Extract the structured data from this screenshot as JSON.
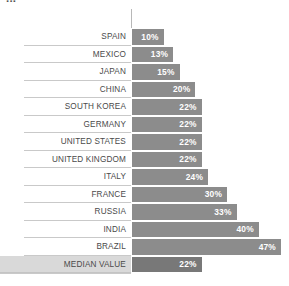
{
  "chart_data": {
    "type": "bar",
    "orientation": "horizontal",
    "title": "...",
    "xlabel": "",
    "ylabel": "",
    "xlim": [
      0,
      50
    ],
    "grid": false,
    "legend": null,
    "value_suffix": "%",
    "categories": [
      "SPAIN",
      "MEXICO",
      "JAPAN",
      "CHINA",
      "SOUTH KOREA",
      "GERMANY",
      "UNITED STATES",
      "UNITED KINGDOM",
      "ITALY",
      "FRANCE",
      "RUSSIA",
      "INDIA",
      "BRAZIL",
      "MEDIAN VALUE"
    ],
    "values": [
      10,
      13,
      15,
      20,
      22,
      22,
      22,
      22,
      24,
      30,
      33,
      40,
      47,
      22
    ],
    "value_labels": [
      "10%",
      "13%",
      "15%",
      "20%",
      "22%",
      "22%",
      "22%",
      "22%",
      "24%",
      "30%",
      "33%",
      "40%",
      "47%",
      "22%"
    ],
    "summary_row_index": 13,
    "colors": {
      "bar": "#8c8c8c",
      "bar_summary": "#787878",
      "value_text": "#ffffff",
      "label_text": "#4a4a4a",
      "summary_label_bg": "#d9d9d9",
      "rule": "#c9c9c9",
      "background": "#ffffff"
    }
  }
}
